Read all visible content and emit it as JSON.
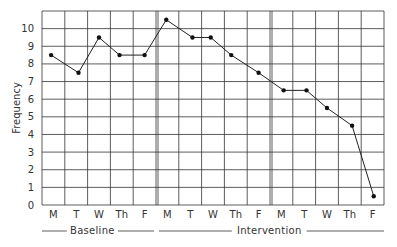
{
  "chart_data": {
    "type": "line",
    "title": "",
    "xlabel": "",
    "ylabel": "Frequency",
    "ylim": [
      0,
      11
    ],
    "yticks": [
      0,
      1,
      2,
      3,
      4,
      5,
      6,
      7,
      8,
      9,
      10
    ],
    "grid": true,
    "legend": null,
    "categories": [
      "M",
      "T",
      "W",
      "Th",
      "F",
      "M",
      "T",
      "W",
      "Th",
      "F",
      "M",
      "T",
      "W",
      "Th",
      "F"
    ],
    "phases": [
      {
        "name": "Baseline",
        "start": 0,
        "end": 4
      },
      {
        "name": "Intervention",
        "start": 5,
        "end": 14
      }
    ],
    "phase_dividers_after_index": [
      4,
      9
    ],
    "series": [
      {
        "name": "Frequency",
        "values": [
          8.5,
          7.5,
          9.5,
          8.5,
          8.5,
          10.5,
          9.5,
          9.5,
          8.5,
          7.5,
          6.5,
          6.5,
          5.5,
          4.5,
          0.5
        ],
        "x_offsets": [
          0.4,
          0.6,
          0.5,
          0.4,
          0.5,
          0.45,
          0.6,
          0.4,
          0.3,
          0.5,
          0.6,
          0.6,
          0.5,
          0.6,
          0.55
        ]
      }
    ]
  },
  "labels": {
    "ylabel": "Frequency",
    "baseline": "Baseline",
    "intervention": "Intervention"
  },
  "style": {
    "line_color": "#222222",
    "grid_color": "#333333",
    "marker_color": "#111111"
  }
}
